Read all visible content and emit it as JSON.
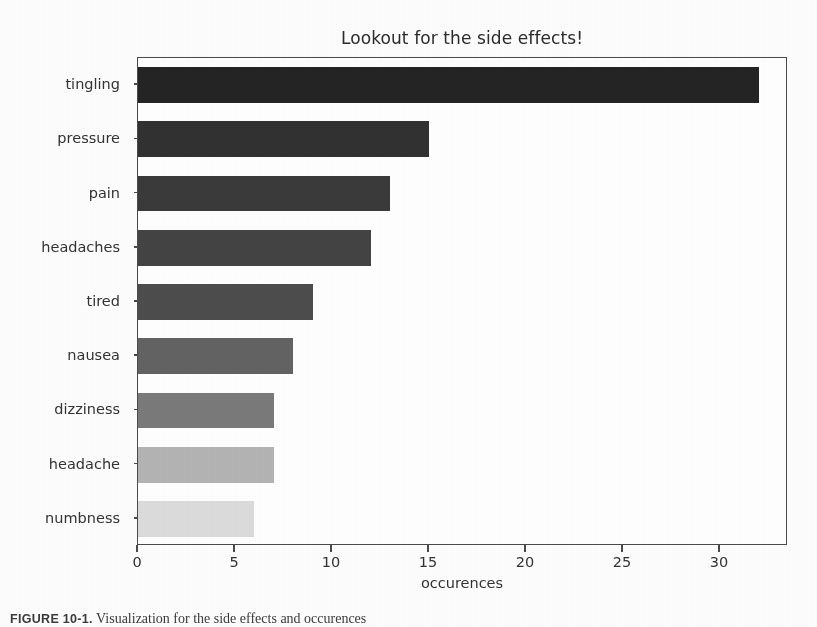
{
  "figure": {
    "caption_label": "FIGURE 10-1.",
    "caption_text": "Visualization for the side effects and occurences"
  },
  "chart_data": {
    "type": "bar",
    "orientation": "horizontal",
    "title": "Lookout for the side effects!",
    "xlabel": "occurences",
    "ylabel": "",
    "categories": [
      "tingling",
      "pressure",
      "pain",
      "headaches",
      "tired",
      "nausea",
      "dizziness",
      "headache",
      "numbness"
    ],
    "values": [
      32,
      15,
      13,
      12,
      9,
      8,
      7,
      7,
      6
    ],
    "bar_colors": [
      "#242424",
      "#313131",
      "#3a3a3a",
      "#444444",
      "#4d4d4d",
      "#636363",
      "#7a7a7a",
      "#b4b4b4",
      "#dcdcdc"
    ],
    "xlim": [
      0,
      33.5
    ],
    "xticks": [
      0,
      5,
      10,
      15,
      20,
      25,
      30
    ],
    "xticklabels": [
      "0",
      "5",
      "10",
      "15",
      "20",
      "25",
      "30"
    ],
    "grid": false,
    "legend": null,
    "axis_color": "#4a4a4a",
    "text_color": "#333333"
  }
}
